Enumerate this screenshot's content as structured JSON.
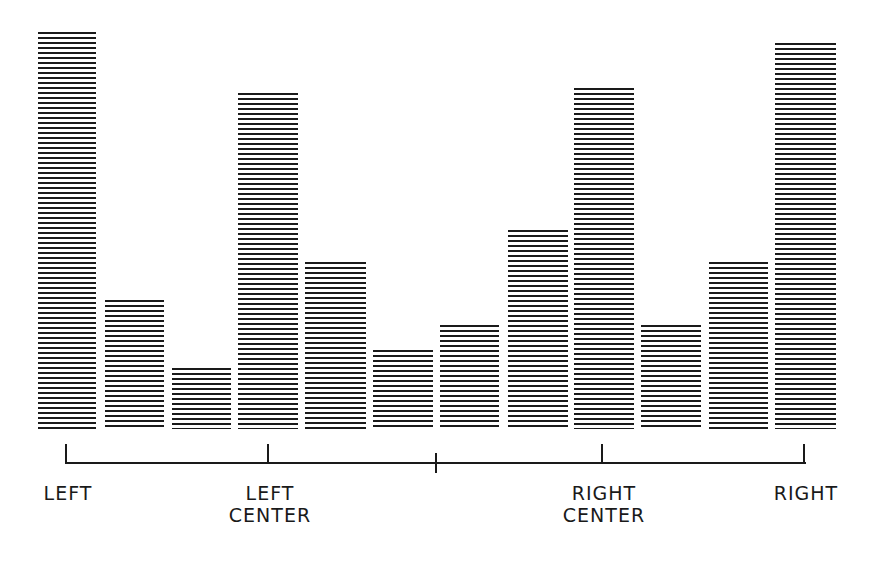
{
  "chart_data": {
    "type": "bar",
    "title": "",
    "xlabel": "",
    "ylabel": "",
    "grid": false,
    "legend": null,
    "style": "horizontal-line hatched bars",
    "categories": [
      "1",
      "2",
      "3",
      "4",
      "5",
      "6",
      "7",
      "8",
      "9",
      "10",
      "11",
      "12"
    ],
    "values": [
      99,
      32,
      15,
      84,
      42,
      20,
      26,
      50,
      86,
      26,
      42,
      97
    ],
    "ylim": [
      0,
      100
    ],
    "axis_ticks": [
      {
        "label": "LEFT",
        "x": 66
      },
      {
        "label": "LEFT\nCENTER",
        "x": 268
      },
      {
        "label": "",
        "x": 436
      },
      {
        "label": "RIGHT\nCENTER",
        "x": 602
      },
      {
        "label": "RIGHT",
        "x": 804
      }
    ]
  },
  "bars": [
    {
      "left": 38,
      "width": 58,
      "top": 32
    },
    {
      "left": 105,
      "width": 59,
      "top": 300
    },
    {
      "left": 172,
      "width": 59,
      "top": 368
    },
    {
      "left": 238,
      "width": 60,
      "top": 93
    },
    {
      "left": 305,
      "width": 61,
      "top": 262
    },
    {
      "left": 373,
      "width": 60,
      "top": 350
    },
    {
      "left": 440,
      "width": 59,
      "top": 325
    },
    {
      "left": 508,
      "width": 60,
      "top": 230
    },
    {
      "left": 574,
      "width": 60,
      "top": 88
    },
    {
      "left": 641,
      "width": 60,
      "top": 325
    },
    {
      "left": 709,
      "width": 59,
      "top": 262
    },
    {
      "left": 775,
      "width": 61,
      "top": 43
    }
  ],
  "baseline": 429,
  "labels": {
    "left": "LEFT",
    "left_center": "LEFT\nCENTER",
    "right_center": "RIGHT\nCENTER",
    "right": "RIGHT"
  }
}
